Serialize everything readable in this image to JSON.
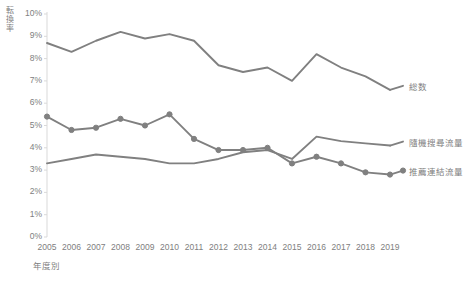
{
  "chart_data": {
    "type": "line",
    "title": "",
    "xlabel": "年度別",
    "ylabel": "転換率",
    "x": [
      2005,
      2006,
      2007,
      2008,
      2009,
      2010,
      2011,
      2012,
      2013,
      2014,
      2015,
      2016,
      2017,
      2018,
      2019
    ],
    "xtick_labels": [
      "2005",
      "2006",
      "2007",
      "2008",
      "2009",
      "2010",
      "2011",
      "2012",
      "2013",
      "2014",
      "2015",
      "2016",
      "2017",
      "2018",
      "2019"
    ],
    "ytick_labels": [
      "10%",
      "9%",
      "8%",
      "7%",
      "6%",
      "5%",
      "4%",
      "3%",
      "2%",
      "1%",
      "0%"
    ],
    "ytick_values": [
      10,
      9,
      8,
      7,
      6,
      5,
      4,
      3,
      2,
      1,
      0
    ],
    "ylim": [
      0,
      10
    ],
    "yunit": "%",
    "grid": false,
    "legend_position": "right-of-plot",
    "series": [
      {
        "name": "総数",
        "color": "#808080",
        "markers": false,
        "values": [
          8.7,
          8.3,
          8.8,
          9.2,
          8.9,
          9.1,
          8.8,
          7.7,
          7.4,
          7.6,
          7.0,
          8.2,
          7.6,
          7.2,
          6.6
        ]
      },
      {
        "name": "隨機搜尋流量",
        "color": "#808080",
        "markers": false,
        "values": [
          3.3,
          3.5,
          3.7,
          3.6,
          3.5,
          3.3,
          3.3,
          3.5,
          3.8,
          3.9,
          3.5,
          4.5,
          4.3,
          4.2,
          4.1
        ]
      },
      {
        "name": "推薦連結流量",
        "color": "#808080",
        "markers": true,
        "values": [
          5.4,
          4.8,
          4.9,
          5.3,
          5.0,
          5.5,
          4.4,
          3.9,
          3.9,
          4.0,
          3.3,
          3.6,
          3.3,
          2.9,
          2.8
        ]
      }
    ]
  },
  "legend": {
    "items": [
      {
        "label": "総数"
      },
      {
        "label": "隨機搜尋流量"
      },
      {
        "label": "推薦連結流量"
      }
    ]
  },
  "colors": {
    "line": "#808080",
    "axis": "#d9d9d9",
    "text": "#808080"
  }
}
